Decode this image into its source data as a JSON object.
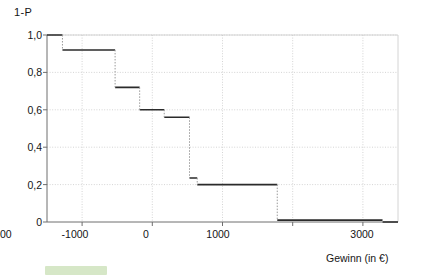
{
  "chart_data": {
    "type": "line",
    "subtype": "step",
    "title": "",
    "xlabel": "Gewinn (in €)",
    "ylabel": "1-P",
    "xlim": [
      -1500,
      3500
    ],
    "ylim": [
      0,
      1.05
    ],
    "grid": true,
    "legend": null,
    "x_ticks": [
      -1000,
      0,
      1000,
      2000,
      3000
    ],
    "x_tick_labels": [
      "-1000",
      "0",
      "1000",
      "2000",
      "3000"
    ],
    "y_ticks": [
      0,
      0.2,
      0.4,
      0.6,
      0.8,
      1.0
    ],
    "y_tick_labels": [
      "0",
      "0,2",
      "0,4",
      "0,6",
      "0,8",
      "1,0"
    ],
    "x_gridlines": [
      -1000,
      0,
      1000,
      2000,
      3000
    ],
    "y_gridlines": [
      0.2,
      0.4,
      0.6,
      0.8,
      1.0
    ],
    "series": [
      {
        "name": "1-P",
        "color": "#2b2b2b",
        "step_points": [
          {
            "x": -1500,
            "y": 1.0
          },
          {
            "x": -1280,
            "y": 0.92
          },
          {
            "x": -530,
            "y": 0.72
          },
          {
            "x": -180,
            "y": 0.6
          },
          {
            "x": 170,
            "y": 0.56
          },
          {
            "x": 530,
            "y": 0.235
          },
          {
            "x": 640,
            "y": 0.2
          },
          {
            "x": 1780,
            "y": 0.01
          },
          {
            "x": 3280,
            "y": 0.0
          },
          {
            "x": 3500,
            "y": 0.0
          }
        ]
      }
    ]
  },
  "axes": {
    "y_title": "1-P",
    "x_title": "Gewinn (in €)",
    "y_labels": [
      {
        "value": 1.0,
        "text": "1,0"
      },
      {
        "value": 0.8,
        "text": "0,8"
      },
      {
        "value": 0.6,
        "text": "0,6"
      },
      {
        "value": 0.4,
        "text": "0,4"
      },
      {
        "value": 0.2,
        "text": "0,2"
      },
      {
        "value": 0.0,
        "text": "0"
      }
    ],
    "x_labels": [
      {
        "value": -1000,
        "text": "-1000"
      },
      {
        "value": 0,
        "text": "0"
      },
      {
        "value": 1000,
        "text": "1000"
      },
      {
        "value": 2000,
        "text": "2000"
      },
      {
        "value": 3000,
        "text": "3000"
      }
    ]
  },
  "colors": {
    "line": "#2b2b2b",
    "grid": "#c9c9c9",
    "axis": "#6e6e6e",
    "text": "#151515",
    "background": "#ffffff",
    "smudge": "#cfe3bd"
  }
}
